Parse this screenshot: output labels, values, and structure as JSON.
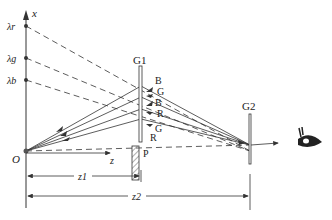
{
  "labels": {
    "x_axis": "x",
    "z_axis": "z",
    "origin": "O",
    "lambda_r": "λr",
    "lambda_g": "λg",
    "lambda_b": "λb",
    "g1": "G1",
    "g2": "G2",
    "p": "P",
    "z1": "z1",
    "z2": "z2",
    "beam_labels": [
      "B",
      "G",
      "B",
      "R",
      "G",
      "R"
    ]
  },
  "colors": {
    "line": "#333333",
    "background": "#ffffff"
  }
}
